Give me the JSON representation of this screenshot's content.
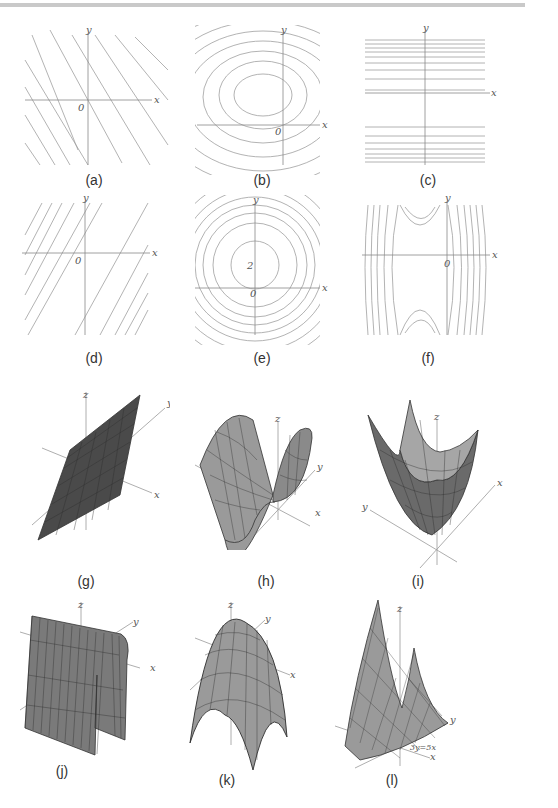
{
  "figure": {
    "panels": [
      {
        "id": "a",
        "label": "(a)",
        "kind": "contour",
        "description": "parallel lines of negative slope",
        "axes": {
          "x": "x",
          "y": "y",
          "origin": "0"
        }
      },
      {
        "id": "b",
        "label": "(b)",
        "kind": "contour",
        "description": "nested ellipses centered in second quadrant",
        "axes": {
          "x": "x",
          "y": "y",
          "origin": "0"
        }
      },
      {
        "id": "c",
        "label": "(c)",
        "kind": "contour",
        "description": "horizontal lines, gap around x-axis",
        "axes": {
          "x": "x",
          "y": "y"
        }
      },
      {
        "id": "d",
        "label": "(d)",
        "kind": "contour",
        "description": "parallel lines of positive slope with gap through origin",
        "axes": {
          "x": "x",
          "y": "y",
          "origin": "0"
        }
      },
      {
        "id": "e",
        "label": "(e)",
        "kind": "contour",
        "description": "concentric circles centered on positive y-axis",
        "axes": {
          "x": "x",
          "y": "y",
          "origin": "0",
          "center_label": "2"
        }
      },
      {
        "id": "f",
        "label": "(f)",
        "kind": "contour",
        "description": "hyperbolic level curves (saddle) left of y-axis",
        "axes": {
          "x": "x",
          "y": "y",
          "origin": "0"
        }
      },
      {
        "id": "g",
        "label": "(g)",
        "kind": "surface",
        "description": "tilted plane",
        "axes": {
          "x": "x",
          "y": "y",
          "z": "z"
        }
      },
      {
        "id": "h",
        "label": "(h)",
        "kind": "surface",
        "description": "saddle-like wave surface",
        "axes": {
          "x": "x",
          "y": "y",
          "z": "z"
        }
      },
      {
        "id": "i",
        "label": "(i)",
        "kind": "surface",
        "description": "upward paraboloid",
        "axes": {
          "x": "x",
          "y": "y",
          "z": "z"
        }
      },
      {
        "id": "j",
        "label": "(j)",
        "kind": "surface",
        "description": "parabolic cylinder (arch)",
        "axes": {
          "x": "x",
          "y": "y",
          "z": "z"
        }
      },
      {
        "id": "k",
        "label": "(k)",
        "kind": "surface",
        "description": "downward paraboloid",
        "axes": {
          "x": "x",
          "y": "y",
          "z": "z"
        }
      },
      {
        "id": "l",
        "label": "(l)",
        "kind": "surface",
        "description": "trough along line",
        "axes": {
          "x": "x",
          "y": "y",
          "z": "z"
        },
        "annotation": "3y=5x"
      }
    ]
  },
  "colors": {
    "line": "#9a9a9a",
    "axis": "#888888",
    "surface_dark": "#4a4a4a",
    "surface_mid": "#8a8a8a",
    "surface_light": "#a8a8a8",
    "caption": "#333333"
  }
}
